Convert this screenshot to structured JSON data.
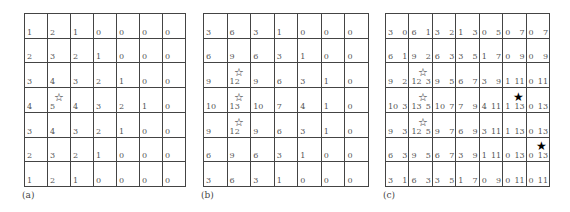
{
  "panels": [
    {
      "label": "(a)",
      "rows": [
        [
          "1",
          "2",
          "1",
          "0",
          "0",
          "0",
          "0"
        ],
        [
          "2",
          "3",
          "2",
          "1",
          "0",
          "0",
          "0"
        ],
        [
          "3",
          "4",
          "3",
          "2",
          "1",
          "0",
          "0"
        ],
        [
          "4",
          "5",
          "4",
          "3",
          "2",
          "1",
          "0"
        ],
        [
          "3",
          "4",
          "3",
          "2",
          "1",
          "0",
          "0"
        ],
        [
          "2",
          "3",
          "2",
          "1",
          "0",
          "0",
          "0"
        ],
        [
          "1",
          "2",
          "1",
          "0",
          "0",
          "0",
          "0"
        ]
      ],
      "open_stars": [
        [
          3,
          1
        ]
      ],
      "filled_stars": []
    },
    {
      "label": "(b)",
      "rows": [
        [
          "3",
          "6",
          "3",
          "1",
          "0",
          "0",
          "0"
        ],
        [
          "6",
          "9",
          "6",
          "3",
          "1",
          "0",
          "0"
        ],
        [
          "9",
          "12",
          "9",
          "6",
          "3",
          "1",
          "0"
        ],
        [
          "10",
          "13",
          "10",
          "7",
          "4",
          "1",
          "0"
        ],
        [
          "9",
          "12",
          "9",
          "6",
          "3",
          "1",
          "0"
        ],
        [
          "6",
          "9",
          "6",
          "3",
          "1",
          "0",
          "0"
        ],
        [
          "3",
          "6",
          "3",
          "1",
          "0",
          "0",
          "0"
        ]
      ],
      "open_stars": [
        [
          2,
          1
        ],
        [
          3,
          1
        ],
        [
          4,
          1
        ]
      ],
      "filled_stars": []
    },
    {
      "label": "(c)",
      "rows": [
        [
          [
            "3",
            "0"
          ],
          [
            "6",
            "1"
          ],
          [
            "3",
            "2"
          ],
          [
            "1",
            "3"
          ],
          [
            "0",
            "5"
          ],
          [
            "0",
            "7"
          ],
          [
            "0",
            "7"
          ]
        ],
        [
          [
            "6",
            "1"
          ],
          [
            "9",
            "2"
          ],
          [
            "6",
            "3"
          ],
          [
            "3",
            "5"
          ],
          [
            "1",
            "7"
          ],
          [
            "0",
            "9"
          ],
          [
            "0",
            "9"
          ]
        ],
        [
          [
            "9",
            "2"
          ],
          [
            "12",
            "3"
          ],
          [
            "9",
            "5"
          ],
          [
            "6",
            "7"
          ],
          [
            "3",
            "9"
          ],
          [
            "1",
            "11"
          ],
          [
            "0",
            "11"
          ]
        ],
        [
          [
            "10",
            "3"
          ],
          [
            "13",
            "5"
          ],
          [
            "10",
            "7"
          ],
          [
            "7",
            "9"
          ],
          [
            "4",
            "11"
          ],
          [
            "1",
            "13"
          ],
          [
            "0",
            "13"
          ]
        ],
        [
          [
            "9",
            "3"
          ],
          [
            "12",
            "5"
          ],
          [
            "9",
            "7"
          ],
          [
            "6",
            "9"
          ],
          [
            "3",
            "11"
          ],
          [
            "1",
            "13"
          ],
          [
            "0",
            "13"
          ]
        ],
        [
          [
            "6",
            "3"
          ],
          [
            "9",
            "5"
          ],
          [
            "6",
            "7"
          ],
          [
            "3",
            "9"
          ],
          [
            "1",
            "11"
          ],
          [
            "0",
            "13"
          ],
          [
            "0",
            "13"
          ]
        ],
        [
          [
            "3",
            "1"
          ],
          [
            "6",
            "3"
          ],
          [
            "3",
            "5"
          ],
          [
            "1",
            "7"
          ],
          [
            "0",
            "9"
          ],
          [
            "0",
            "11"
          ],
          [
            "0",
            "11"
          ]
        ]
      ],
      "open_stars": [
        [
          2,
          1
        ],
        [
          3,
          1
        ],
        [
          4,
          1
        ]
      ],
      "filled_stars": [
        [
          3,
          5
        ],
        [
          5,
          6
        ]
      ]
    }
  ],
  "icons": {
    "open_star": "☆",
    "filled_star": "★"
  }
}
